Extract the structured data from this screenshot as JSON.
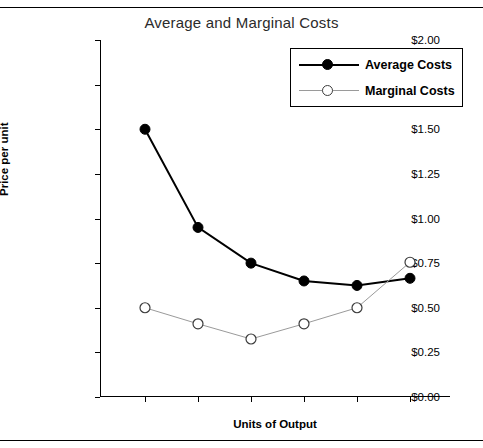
{
  "page": {
    "rule_top": "",
    "rule_bottom": ""
  },
  "chart_data": {
    "type": "line",
    "title": "Average and Marginal Costs",
    "xlabel": "Units of Output",
    "ylabel": "Price per unit",
    "x": [
      1,
      2,
      3,
      4,
      5,
      6
    ],
    "categories": [
      "1",
      "2",
      "3",
      "4",
      "5",
      "6"
    ],
    "ylim": [
      0,
      2.0
    ],
    "ytick_values": [
      0,
      0.25,
      0.5,
      0.75,
      1.0,
      1.25,
      1.5,
      1.75,
      2.0
    ],
    "ytick_labels": [
      "$0.00",
      "$0.25",
      "$0.50",
      "$0.75",
      "$1.00",
      "$1.25",
      "$1.50",
      "$1.75",
      "$2.00"
    ],
    "xtick_labels": [
      "",
      "",
      "",
      "",
      "",
      ""
    ],
    "grid": false,
    "legend_position": "top-right",
    "series": [
      {
        "name": "Average Costs",
        "values": [
          1.5,
          0.95,
          0.75,
          0.65,
          0.625,
          0.665
        ],
        "color": "#000000",
        "marker": "filled-circle",
        "line_width": 2
      },
      {
        "name": "Marginal Costs",
        "values": [
          0.5,
          0.41,
          0.325,
          0.41,
          0.5,
          0.755
        ],
        "color": "#9a9a9a",
        "marker": "open-circle",
        "line_width": 1
      }
    ]
  }
}
